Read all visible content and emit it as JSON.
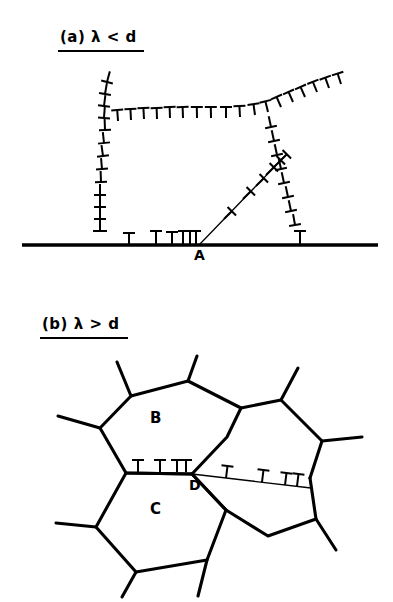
{
  "figure": {
    "title_a": "(a)  λ < d",
    "title_b": "(b)  λ > d",
    "background_color": "#ffffff",
    "ink_color": "#000000"
  },
  "panel_a": {
    "label": "(a)  λ < d",
    "label_x": 60,
    "label_y": 38,
    "underline": true,
    "node_label": "A",
    "node_label_x": 200,
    "node_label_y": 261,
    "node_x": 199,
    "node_y": 245,
    "baseline_y": 245,
    "baseline_x1": 22,
    "baseline_x2": 378,
    "description": "Low-angle boundary meeting a high-angle grain boundary at node A; dislocation (inverted-T) symbols pile up with spacing lambda smaller than grain size d.",
    "boundaries": [
      {
        "name": "left-boundary",
        "style": "dislocation-chain",
        "points": [
          [
            106,
            82
          ],
          [
            102,
            108
          ],
          [
            103,
            128
          ],
          [
            104,
            150
          ],
          [
            101,
            176
          ],
          [
            99,
            200
          ],
          [
            98,
            222
          ],
          [
            98,
            243
          ]
        ]
      },
      {
        "name": "upper-horizontal-boundary",
        "style": "dislocation-chain",
        "points": [
          [
            107,
            122
          ],
          [
            140,
            118
          ],
          [
            175,
            117
          ],
          [
            210,
            117
          ],
          [
            243,
            116
          ],
          [
            268,
            112
          ]
        ]
      },
      {
        "name": "upper-right-branch",
        "style": "dislocation-chain",
        "points": [
          [
            268,
            112
          ],
          [
            292,
            100
          ],
          [
            318,
            90
          ],
          [
            340,
            82
          ]
        ]
      },
      {
        "name": "right-boundary",
        "style": "dislocation-chain",
        "points": [
          [
            268,
            112
          ],
          [
            273,
            136
          ],
          [
            278,
            158
          ],
          [
            283,
            180
          ],
          [
            288,
            204
          ],
          [
            294,
            226
          ],
          [
            299,
            243
          ]
        ]
      },
      {
        "name": "inclined-slip-line-from-A",
        "style": "thin-line-with-dislocations",
        "points": [
          [
            199,
            245
          ],
          [
            284,
            157
          ]
        ]
      },
      {
        "name": "baseline-grain-boundary",
        "style": "thick-straight",
        "points": [
          [
            22,
            245
          ],
          [
            378,
            245
          ]
        ]
      }
    ],
    "dislocation_symbol": "⊥",
    "baseline_dislocations_x": [
      101,
      128,
      155,
      172,
      182,
      189,
      194,
      299
    ],
    "counts": {
      "baseline_symbols": 8,
      "left_chain_symbols": 14,
      "upper_chain_symbols": 12,
      "right_chain_symbols": 10,
      "upper_right_branch_symbols": 7,
      "slip_line_symbols": 7
    }
  },
  "panel_b": {
    "label": "(b)  λ > d",
    "label_x": 42,
    "label_y": 325,
    "underline": true,
    "node_label": "D",
    "node_label_x": 196,
    "node_label_y": 492,
    "node_x": 192,
    "node_y": 474,
    "grain_labels": [
      {
        "text": "B",
        "x": 155,
        "y": 419
      },
      {
        "text": "C",
        "x": 155,
        "y": 510
      }
    ],
    "description": "Coarse dislocation spacing lambda greater than grain size d; grains B and C meet at triple node D with dislocation walls along the B/C boundary and along the thin boundary to the right of D.",
    "grain_B": {
      "name": "grain-B",
      "vertices": [
        [
          131,
          396
        ],
        [
          188,
          381
        ],
        [
          241,
          408
        ],
        [
          227,
          437
        ],
        [
          192,
          474
        ],
        [
          126,
          473
        ],
        [
          100,
          428
        ]
      ]
    },
    "grain_C": {
      "name": "grain-C",
      "vertices": [
        [
          126,
          473
        ],
        [
          192,
          474
        ],
        [
          226,
          510
        ],
        [
          207,
          560
        ],
        [
          136,
          572
        ],
        [
          96,
          527
        ]
      ]
    },
    "grain_right_upper": {
      "name": "grain-right-upper",
      "vertices": [
        [
          241,
          408
        ],
        [
          281,
          400
        ],
        [
          322,
          441
        ],
        [
          310,
          478
        ],
        [
          192,
          474
        ],
        [
          227,
          437
        ]
      ]
    },
    "grain_right_lower": {
      "name": "grain-right-lower",
      "vertices": [
        [
          192,
          474
        ],
        [
          310,
          478
        ],
        [
          316,
          519
        ],
        [
          268,
          536
        ],
        [
          226,
          510
        ]
      ]
    },
    "spurs": [
      {
        "name": "spur-top-left",
        "points": [
          [
            131,
            396
          ],
          [
            117,
            362
          ]
        ]
      },
      {
        "name": "spur-top-mid",
        "points": [
          [
            188,
            381
          ],
          [
            197,
            356
          ]
        ]
      },
      {
        "name": "spur-left-up",
        "points": [
          [
            100,
            428
          ],
          [
            58,
            416
          ]
        ]
      },
      {
        "name": "spur-left-low",
        "points": [
          [
            96,
            527
          ],
          [
            56,
            523
          ]
        ]
      },
      {
        "name": "spur-bot-left",
        "points": [
          [
            136,
            572
          ],
          [
            122,
            597
          ]
        ]
      },
      {
        "name": "spur-bot-right",
        "points": [
          [
            207,
            560
          ],
          [
            198,
            596
          ]
        ]
      },
      {
        "name": "spur-right-top",
        "points": [
          [
            281,
            400
          ],
          [
            298,
            368
          ]
        ]
      },
      {
        "name": "spur-right-mid",
        "points": [
          [
            322,
            441
          ],
          [
            362,
            437
          ]
        ]
      },
      {
        "name": "spur-right-low",
        "points": [
          [
            316,
            519
          ],
          [
            336,
            550
          ]
        ]
      }
    ],
    "boundary_BC": {
      "name": "boundary-B-C",
      "points": [
        [
          126,
          473
        ],
        [
          192,
          474
        ]
      ],
      "dislocations_x": [
        137,
        157,
        175,
        183
      ],
      "count": 4
    },
    "boundary_D_right": {
      "name": "thin-boundary-right-of-D",
      "points": [
        [
          192,
          474
        ],
        [
          310,
          487
        ]
      ],
      "style": "thin",
      "dislocation_t": [
        0.28,
        0.6,
        0.78,
        0.88
      ],
      "count": 4
    },
    "dislocation_symbol": "⊥"
  }
}
